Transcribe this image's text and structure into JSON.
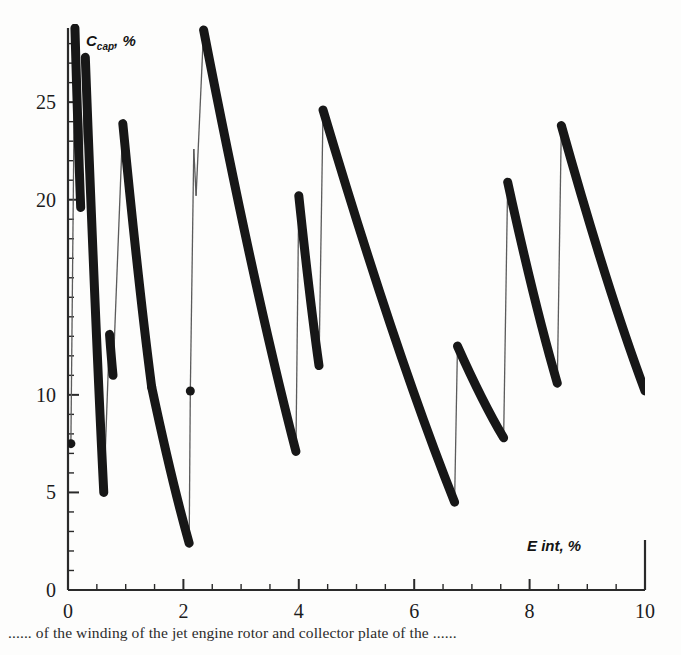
{
  "figure": {
    "background": "#fdfdfc",
    "ink_color": "#171717",
    "thin_line_color": "#5b5b5b",
    "caption": "...... of the winding of the jet engine rotor and collector plate of the ......"
  },
  "axes": {
    "x_title_main": "E",
    "x_title_rest": " int, %",
    "y_title_main": "C",
    "y_title_sub": "cap",
    "y_title_rest": ", %",
    "x_ticks": [
      0,
      2,
      4,
      6,
      8,
      10
    ],
    "x_tick_labels": [
      "0",
      "2",
      "4",
      "6",
      "8",
      "10"
    ],
    "y_ticks": [
      0,
      5,
      10,
      20,
      25
    ],
    "y_tick_labels": [
      "0",
      "5",
      "10",
      "20",
      "25"
    ],
    "x_minor_step": 0.5,
    "y_minor_step": 1,
    "x_range": [
      0,
      10
    ],
    "y_range": [
      0,
      28.8
    ],
    "plot_left_px": 68,
    "plot_right_px": 645,
    "plot_bottom_px": 590,
    "plot_top_px": 28
  },
  "chart_data": {
    "type": "line",
    "title": "",
    "subtitle": "",
    "xlabel": "E int, %",
    "ylabel": "C_cap, %",
    "xlim": [
      0,
      10
    ],
    "ylim": [
      0,
      28.8
    ],
    "grid": false,
    "legend": null,
    "series": [
      {
        "name": "C_cap vs E_int (sawtooth relaxation curve)",
        "style": "thick-solid-with-round-caps",
        "linewidth_px": 9,
        "comment": "Sequence of saw teeth: each tooth rises steeply (thin connector drawn down/up) then decays along a thick falling branch. Points are (E_int %, C_cap %) traversed in order.",
        "points": [
          [
            0.05,
            7.5
          ],
          [
            0.12,
            28.8
          ],
          [
            0.22,
            19.6
          ],
          [
            0.3,
            27.3
          ],
          [
            0.62,
            5.0
          ],
          [
            0.72,
            13.1
          ],
          [
            0.78,
            11.0
          ],
          [
            0.95,
            23.9
          ],
          [
            1.45,
            10.4
          ],
          [
            2.1,
            2.4
          ],
          [
            2.12,
            10.2
          ],
          [
            2.18,
            22.6
          ],
          [
            2.22,
            20.2
          ],
          [
            2.35,
            28.7
          ],
          [
            3.95,
            7.1
          ],
          [
            4.0,
            20.2
          ],
          [
            4.35,
            11.5
          ],
          [
            4.42,
            24.6
          ],
          [
            6.7,
            4.5
          ],
          [
            6.75,
            12.5
          ],
          [
            7.55,
            7.8
          ],
          [
            7.62,
            20.9
          ],
          [
            8.48,
            10.6
          ],
          [
            8.55,
            23.8
          ],
          [
            10.0,
            10.2
          ]
        ],
        "teeth": [
          {
            "rise_x": 0.12,
            "peak": 28.8,
            "fall_to_x": 0.22,
            "trough": 19.6
          },
          {
            "rise_x": 0.3,
            "peak": 27.3,
            "fall_to_x": 0.62,
            "trough": 5.0
          },
          {
            "rise_x": 0.72,
            "peak": 13.1,
            "fall_to_x": 0.78,
            "trough": 11.0
          },
          {
            "rise_x": 0.95,
            "peak": 23.9,
            "fall_to_x": 2.1,
            "trough": 2.4
          },
          {
            "rise_x": 2.18,
            "peak": 22.6,
            "fall_to_x": 2.22,
            "trough": 20.2
          },
          {
            "rise_x": 2.35,
            "peak": 28.7,
            "fall_to_x": 3.95,
            "trough": 7.1
          },
          {
            "rise_x": 4.0,
            "peak": 20.2,
            "fall_to_x": 4.35,
            "trough": 11.5
          },
          {
            "rise_x": 4.42,
            "peak": 24.6,
            "fall_to_x": 6.7,
            "trough": 4.5
          },
          {
            "rise_x": 6.75,
            "peak": 12.5,
            "fall_to_x": 7.55,
            "trough": 7.8
          },
          {
            "rise_x": 7.62,
            "peak": 20.9,
            "fall_to_x": 8.48,
            "trough": 10.6
          },
          {
            "rise_x": 8.55,
            "peak": 23.8,
            "fall_to_x": 10.0,
            "trough": 10.2
          }
        ],
        "isolated_markers": [
          [
            0.05,
            7.5
          ],
          [
            2.12,
            10.2
          ]
        ]
      }
    ]
  }
}
